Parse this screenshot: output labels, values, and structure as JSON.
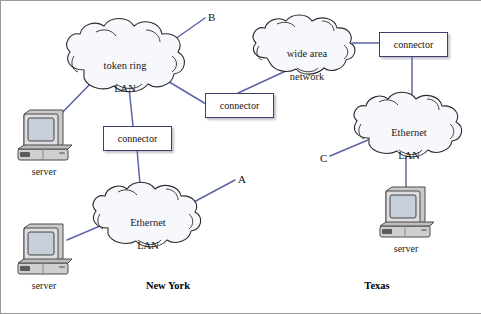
{
  "diagram": {
    "background_color": "#ffffff",
    "link_color": "#5a64a8",
    "cloud_fill": "#f7f8fc",
    "cloud_stroke": "#2b2b2b",
    "box_stroke": "#3f3f6e"
  },
  "clouds": [
    {
      "id": "token-ring-lan",
      "label": "token ring\nLAN",
      "label_line1": "token ring",
      "label_line2": "LAN",
      "center_x": 125,
      "center_y": 60
    },
    {
      "id": "ethernet-lan-ny",
      "label": "Ethernet\nLAN",
      "label_line1": "Ethernet",
      "label_line2": "LAN",
      "center_x": 148,
      "center_y": 217
    },
    {
      "id": "wide-area-network",
      "label": "wide area\nnetwork",
      "label_line1": "wide area",
      "label_line2": "network",
      "center_x": 307,
      "center_y": 48
    },
    {
      "id": "ethernet-lan-tx",
      "label": "Ethernet\nLAN",
      "label_line1": "Ethernet",
      "label_line2": "LAN",
      "center_x": 409,
      "center_y": 127
    }
  ],
  "connectors": [
    {
      "id": "connector-ny-token-ring",
      "label": "connector",
      "x": 103,
      "y": 126,
      "w": 67,
      "h": 23
    },
    {
      "id": "connector-ny-to-wan",
      "label": "connector",
      "x": 205,
      "y": 93,
      "w": 67,
      "h": 23
    },
    {
      "id": "connector-tx-wan",
      "label": "connector",
      "x": 379,
      "y": 32,
      "w": 67,
      "h": 23
    }
  ],
  "servers": [
    {
      "id": "server-ny-token-ring",
      "label": "server",
      "x": 16,
      "y": 108,
      "label_y": 166
    },
    {
      "id": "server-ny-ethernet",
      "label": "server",
      "x": 16,
      "y": 222,
      "label_y": 280
    },
    {
      "id": "server-tx-ethernet",
      "label": "server",
      "x": 378,
      "y": 185,
      "label_y": 243
    }
  ],
  "endpoints": [
    {
      "id": "endpoint-b",
      "label": "B",
      "x": 208,
      "y": 11
    },
    {
      "id": "endpoint-a",
      "label": "A",
      "x": 238,
      "y": 173
    },
    {
      "id": "endpoint-c",
      "label": "C",
      "x": 320,
      "y": 152
    }
  ],
  "sites": [
    {
      "id": "site-new-york",
      "label": "New York",
      "center_x": 168,
      "y": 280
    },
    {
      "id": "site-texas",
      "label": "Texas",
      "center_x": 377,
      "y": 280
    }
  ],
  "links": [
    {
      "id": "link-token-ring-to-b",
      "from": "token-ring-lan",
      "to": "endpoint-b"
    },
    {
      "id": "link-token-ring-to-server-ny",
      "from": "token-ring-lan",
      "to": "server-ny-token-ring"
    },
    {
      "id": "link-token-ring-to-connector1",
      "from": "token-ring-lan",
      "to": "connector-ny-token-ring"
    },
    {
      "id": "link-token-ring-to-connector2",
      "from": "token-ring-lan",
      "to": "connector-ny-to-wan"
    },
    {
      "id": "link-connector1-to-ethernet-ny",
      "from": "connector-ny-token-ring",
      "to": "ethernet-lan-ny"
    },
    {
      "id": "link-ethernet-ny-to-server",
      "from": "ethernet-lan-ny",
      "to": "server-ny-ethernet"
    },
    {
      "id": "link-ethernet-ny-to-a",
      "from": "ethernet-lan-ny",
      "to": "endpoint-a"
    },
    {
      "id": "link-connector2-to-wan",
      "from": "connector-ny-to-wan",
      "to": "wide-area-network"
    },
    {
      "id": "link-wan-to-connector3",
      "from": "wide-area-network",
      "to": "connector-tx-wan"
    },
    {
      "id": "link-connector3-to-ethernet-tx",
      "from": "connector-tx-wan",
      "to": "ethernet-lan-tx"
    },
    {
      "id": "link-ethernet-tx-to-c",
      "from": "ethernet-lan-tx",
      "to": "endpoint-c"
    },
    {
      "id": "link-ethernet-tx-to-server",
      "from": "ethernet-lan-tx",
      "to": "server-tx-ethernet"
    }
  ]
}
